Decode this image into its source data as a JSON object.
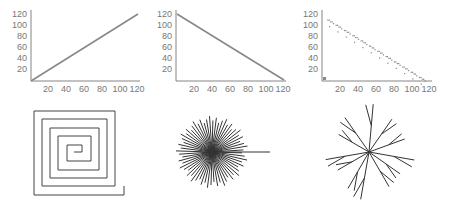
{
  "chart_data": [
    {
      "type": "line",
      "title": "",
      "xlabel": "",
      "ylabel": "",
      "x_ticks": [
        "20",
        "40",
        "60",
        "80",
        "100",
        "120"
      ],
      "y_ticks": [
        "20",
        "40",
        "60",
        "80",
        "100",
        "120"
      ],
      "xlim": [
        0,
        122
      ],
      "ylim": [
        0,
        122
      ],
      "series": [
        {
          "name": "increasing",
          "x": [
            0,
            122
          ],
          "y": [
            0,
            122
          ]
        }
      ]
    },
    {
      "type": "line",
      "title": "",
      "xlabel": "",
      "ylabel": "",
      "x_ticks": [
        "20",
        "40",
        "60",
        "80",
        "100",
        "120"
      ],
      "y_ticks": [
        "20",
        "40",
        "60",
        "80",
        "100",
        "120"
      ],
      "xlim": [
        0,
        122
      ],
      "ylim": [
        0,
        122
      ],
      "series": [
        {
          "name": "decreasing",
          "x": [
            0,
            122
          ],
          "y": [
            122,
            0
          ]
        }
      ]
    },
    {
      "type": "scatter",
      "title": "",
      "xlabel": "",
      "ylabel": "",
      "x_ticks": [
        "20",
        "40",
        "60",
        "80",
        "100",
        "120"
      ],
      "y_ticks": [
        "20",
        "40",
        "60",
        "80",
        "100",
        "120"
      ],
      "xlim": [
        0,
        122
      ],
      "ylim": [
        0,
        122
      ],
      "series": [
        {
          "name": "decreasing-grouped-points",
          "pattern": "groups of ~5 points along y = 120 - x, with an outlier below each group"
        }
      ]
    },
    {
      "type": "diagram",
      "title": "",
      "description": "square spiral, ~5 turns, opening at bottom right"
    },
    {
      "type": "diagram",
      "title": "",
      "description": "radial starburst of ~60 rays with one longer ray pointing right"
    },
    {
      "type": "diagram",
      "title": "",
      "description": "random branching star/tree pattern radiating from center"
    }
  ],
  "axis_color": "#555555",
  "line_color": "#777777",
  "shape_color": "#333333"
}
